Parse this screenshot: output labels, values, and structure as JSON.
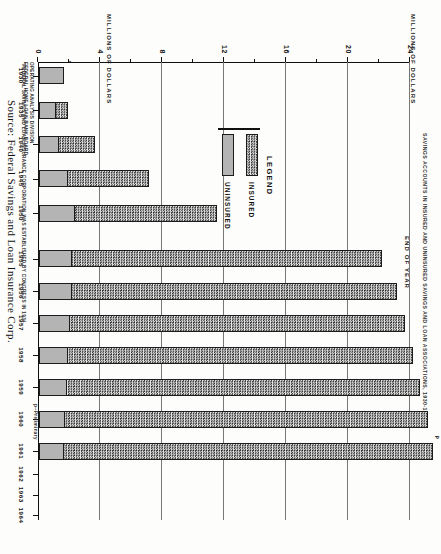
{
  "figure": {
    "title": "SAVINGS ACCOUNTS IN INSURED AND UNINSURED SAVINGS AND LOAN ASSOCIATIONS, 1930-1964",
    "value_axis_caption_left": "MILLIONS OF DOLLARS",
    "value_axis_caption_right": "MILLIONS OF DOLLARS",
    "category_axis_caption": "END OF YEAR",
    "source": "Source:  Federal Savings and Loan Insurance Corp."
  },
  "legend": {
    "title": "LEGEND",
    "items": [
      {
        "label": "INSURED",
        "pattern": "checkered",
        "color": "#c9c9c9"
      },
      {
        "label": "UNINSURED",
        "pattern": "solid",
        "color": "#b4b4b4"
      }
    ]
  },
  "footnotes": {
    "star": "*FEDERAL SAVINGS AND LOAN INSURANCE CORPORATION WAS ESTABLISHED BY CONGRESS IN 1934",
    "preliminary": "p--Preliminary",
    "division_line1": "OPERATING ANALYSIS DIVISION",
    "division_line2": "FEDERAL HOME LOAN BANK BOARD"
  },
  "chart_data": {
    "type": "bar",
    "orientation": "horizontal",
    "title": "SAVINGS ACCOUNTS IN INSURED AND UNINSURED SAVINGS AND LOAN ASSOCIATIONS, 1930-1964",
    "xlabel": "END OF YEAR",
    "ylabel": "MILLIONS OF DOLLARS",
    "ylim": [
      0,
      24
    ],
    "yticks": [
      0,
      4,
      8,
      12,
      16,
      20,
      24
    ],
    "ytick_labels": [
      "0",
      "4",
      "8",
      "12",
      "16",
      "20",
      "24"
    ],
    "yminor_step": 2,
    "grid": true,
    "legend_position": "center-left",
    "categories": [
      "1930",
      "1935",
      "1940",
      "1945",
      "1950",
      "1955",
      "1956",
      "1957",
      "1958",
      "1959",
      "1960",
      "1961",
      "1962",
      "1963",
      "1964"
    ],
    "series": [
      {
        "name": "INSURED",
        "values": [
          0,
          0.8,
          2.3,
          5.2,
          9.2,
          20.0,
          21.0,
          21.6,
          22.2,
          22.8,
          23.4,
          23.8,
          null,
          null,
          null
        ]
      },
      {
        "name": "UNINSURED",
        "values": [
          1.6,
          1.1,
          1.3,
          1.9,
          2.3,
          2.1,
          2.1,
          2.0,
          1.9,
          1.8,
          1.7,
          1.6,
          null,
          null,
          null
        ]
      }
    ],
    "annotations": [
      {
        "category": "1930",
        "text": "*",
        "note": "FSLIC established by Congress in 1934"
      },
      {
        "category": "1961",
        "text": "p",
        "note": "preliminary"
      }
    ]
  }
}
